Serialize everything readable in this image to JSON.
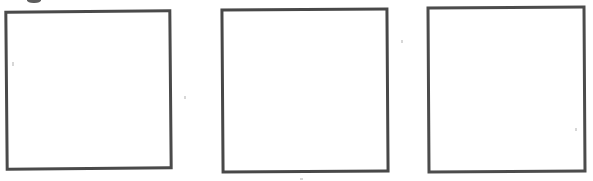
{
  "page": {
    "background_color": "#ffffff",
    "width": 593,
    "height": 181
  },
  "boxes": [
    {
      "id": "answer-box-1",
      "label": "",
      "x": 5,
      "y": 10,
      "width": 167,
      "height": 160,
      "border_width": 3,
      "border_color": "#4a4a4a",
      "fill_color": "#ffffff",
      "rotation_deg": -0.5
    },
    {
      "id": "answer-box-2",
      "label": "",
      "x": 221,
      "y": 8,
      "width": 168,
      "height": 165,
      "border_width": 3,
      "border_color": "#484848",
      "fill_color": "#ffffff",
      "rotation_deg": -0.4
    },
    {
      "id": "answer-box-3",
      "label": "",
      "x": 427,
      "y": 6,
      "width": 159,
      "height": 167,
      "border_width": 3,
      "border_color": "#4c4c4c",
      "fill_color": "#ffffff",
      "rotation_deg": -0.35
    }
  ],
  "artifacts": {
    "clipped_glyph": {
      "name": "clipped-glyph-artifact",
      "x": 27,
      "y": -4,
      "width": 14,
      "height": 7,
      "color": "#3a3a3a"
    },
    "specks": [
      {
        "x": 12,
        "y": 62,
        "width": 2,
        "height": 4,
        "color": "#8d8d8d"
      },
      {
        "x": 184,
        "y": 96,
        "width": 2,
        "height": 3,
        "color": "#8d8d8d"
      },
      {
        "x": 401,
        "y": 40,
        "width": 2,
        "height": 3,
        "color": "#8d8d8d"
      },
      {
        "x": 575,
        "y": 128,
        "width": 2,
        "height": 3,
        "color": "#8d8d8d"
      },
      {
        "x": 300,
        "y": 178,
        "width": 3,
        "height": 2,
        "color": "#8d8d8d"
      }
    ]
  }
}
